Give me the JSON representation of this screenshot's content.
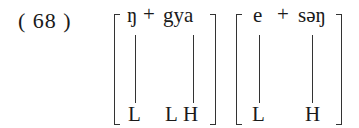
{
  "example": {
    "number": "( 68 )",
    "group1": {
      "segment1": "ŋ",
      "plus": "+",
      "segment2": "gya",
      "tones": [
        "L",
        "L",
        "H"
      ]
    },
    "group2": {
      "segment1": "e",
      "plus": "+",
      "segment2": "səŋ",
      "tones": [
        "L",
        "H"
      ]
    }
  }
}
